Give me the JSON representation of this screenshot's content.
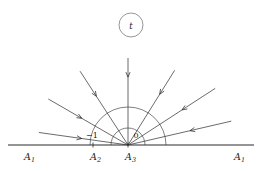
{
  "figure": {
    "name": "reflection-diagram",
    "background_color": "#ffffff",
    "stroke_color": "#3a3a3a",
    "text_color": "#1a1a1a"
  },
  "node_marker": {
    "label": "t",
    "cx": 131,
    "cy": 25,
    "r": 12
  },
  "baseline": {
    "name": "horizontal-axis",
    "y": 145,
    "x_start": 8,
    "x_end": 254,
    "ticks": [
      {
        "label": "A",
        "sub": "2",
        "x": 93
      },
      {
        "label": "A",
        "sub": "3",
        "x": 128
      }
    ]
  },
  "axis_labels": [
    {
      "id": "left-a1",
      "label": "A",
      "sub": "1",
      "x": 24,
      "y": 160
    },
    {
      "id": "a2",
      "label": "A",
      "sub": "2",
      "x": 90,
      "y": 160
    },
    {
      "id": "a3",
      "label": "A",
      "sub": "3",
      "x": 125,
      "y": 160
    },
    {
      "id": "right-a1",
      "label": "A",
      "sub": "1",
      "x": 234,
      "y": 160
    }
  ],
  "angle_labels": [
    {
      "id": "minus-one",
      "text": "−1",
      "x": 92,
      "y": 138
    },
    {
      "id": "zero",
      "text": "0",
      "x": 136,
      "y": 138
    }
  ],
  "arcs": [
    {
      "id": "outer-arc",
      "cx": 128,
      "cy": 145,
      "r": 38
    },
    {
      "id": "inner-arc",
      "cx": 128,
      "cy": 145,
      "r": 17
    }
  ],
  "origin": {
    "x": 128,
    "y": 145
  },
  "rays": [
    {
      "id": "ray-1",
      "angle_deg": 172,
      "length": 90,
      "arrow_at": 0.52,
      "direction": "inward"
    },
    {
      "id": "ray-2",
      "angle_deg": 150,
      "length": 92,
      "arrow_at": 0.58,
      "direction": "inward"
    },
    {
      "id": "ray-3",
      "angle_deg": 123,
      "length": 88,
      "arrow_at": 0.66,
      "direction": "inward"
    },
    {
      "id": "ray-4",
      "angle_deg": 90,
      "length": 87,
      "arrow_at": 0.78,
      "direction": "inward"
    },
    {
      "id": "ray-5",
      "angle_deg": 58,
      "length": 88,
      "arrow_at": 0.68,
      "direction": "inward"
    },
    {
      "id": "ray-6",
      "angle_deg": 33,
      "length": 104,
      "arrow_at": 0.62,
      "direction": "inward"
    },
    {
      "id": "ray-7",
      "angle_deg": 13,
      "length": 106,
      "arrow_at": 0.6,
      "direction": "inward"
    }
  ]
}
